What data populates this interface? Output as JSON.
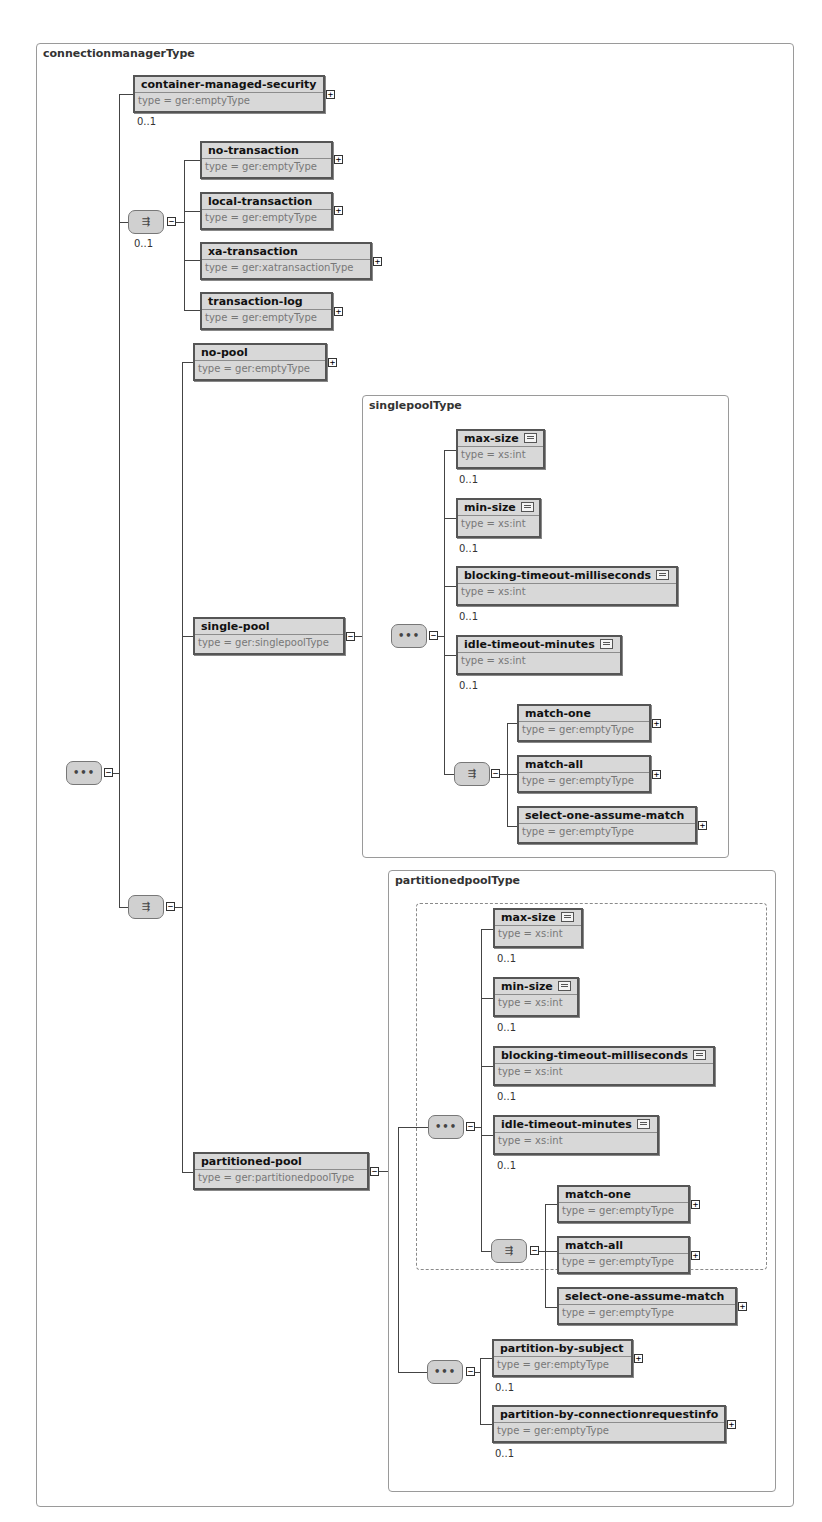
{
  "diagram": {
    "root_type": "connectionmanagerType",
    "compositors": {
      "root_sequence": {
        "kind": "sequence",
        "glyph": "•••",
        "expander": "−"
      },
      "transaction_choice": {
        "kind": "choice",
        "glyph": "⇶",
        "expander": "−",
        "occurrence": "0..1"
      },
      "pool_choice": {
        "kind": "choice",
        "glyph": "⇶",
        "expander": "−"
      },
      "singlepool_sequence": {
        "kind": "sequence",
        "glyph": "•••",
        "expander": "−"
      },
      "singlepool_match_choice": {
        "kind": "choice",
        "glyph": "⇶",
        "expander": "−"
      },
      "partitioned_sequence": {
        "kind": "sequence",
        "glyph": "•••",
        "expander": "−"
      },
      "partitioned_match_choice": {
        "kind": "choice",
        "glyph": "⇶",
        "expander": "−"
      },
      "partition_by_sequence": {
        "kind": "sequence",
        "glyph": "•••",
        "expander": "−"
      }
    },
    "elements": {
      "container_managed_security": {
        "name": "container-managed-security",
        "type": "type = ger:emptyType",
        "occurrence": "0..1",
        "expander": "+"
      },
      "no_transaction": {
        "name": "no-transaction",
        "type": "type = ger:emptyType",
        "expander": "+"
      },
      "local_transaction": {
        "name": "local-transaction",
        "type": "type = ger:emptyType",
        "expander": "+"
      },
      "xa_transaction": {
        "name": "xa-transaction",
        "type": "type = ger:xatransactionType",
        "expander": "+"
      },
      "transaction_log": {
        "name": "transaction-log",
        "type": "type = ger:emptyType",
        "expander": "+"
      },
      "no_pool": {
        "name": "no-pool",
        "type": "type = ger:emptyType",
        "expander": "+"
      },
      "single_pool": {
        "name": "single-pool",
        "type": "type = ger:singlepoolType",
        "expander": "−"
      },
      "partitioned_pool": {
        "name": "partitioned-pool",
        "type": "type = ger:partitionedpoolType",
        "expander": "−"
      }
    },
    "singlepool": {
      "type_name": "singlepoolType",
      "items": [
        {
          "name": "max-size",
          "type": "type = xs:int",
          "occurrence": "0..1"
        },
        {
          "name": "min-size",
          "type": "type = xs:int",
          "occurrence": "0..1"
        },
        {
          "name": "blocking-timeout-milliseconds",
          "type": "type = xs:int",
          "occurrence": "0..1"
        },
        {
          "name": "idle-timeout-minutes",
          "type": "type = xs:int",
          "occurrence": "0..1"
        }
      ],
      "match": [
        {
          "name": "match-one",
          "type": "type = ger:emptyType",
          "expander": "+"
        },
        {
          "name": "match-all",
          "type": "type = ger:emptyType",
          "expander": "+"
        },
        {
          "name": "select-one-assume-match",
          "type": "type = ger:emptyType",
          "expander": "+"
        }
      ]
    },
    "partitionedpool": {
      "type_name": "partitionedpoolType",
      "items": [
        {
          "name": "max-size",
          "type": "type = xs:int",
          "occurrence": "0..1"
        },
        {
          "name": "min-size",
          "type": "type = xs:int",
          "occurrence": "0..1"
        },
        {
          "name": "blocking-timeout-milliseconds",
          "type": "type = xs:int",
          "occurrence": "0..1"
        },
        {
          "name": "idle-timeout-minutes",
          "type": "type = xs:int",
          "occurrence": "0..1"
        }
      ],
      "match": [
        {
          "name": "match-one",
          "type": "type = ger:emptyType",
          "expander": "+"
        },
        {
          "name": "match-all",
          "type": "type = ger:emptyType",
          "expander": "+"
        },
        {
          "name": "select-one-assume-match",
          "type": "type = ger:emptyType",
          "expander": "+"
        }
      ],
      "partition_by": [
        {
          "name": "partition-by-subject",
          "type": "type = ger:emptyType",
          "occurrence": "0..1",
          "expander": "+"
        },
        {
          "name": "partition-by-connectionrequestinfo",
          "type": "type = ger:emptyType",
          "occurrence": "0..1",
          "expander": "+"
        }
      ]
    }
  }
}
